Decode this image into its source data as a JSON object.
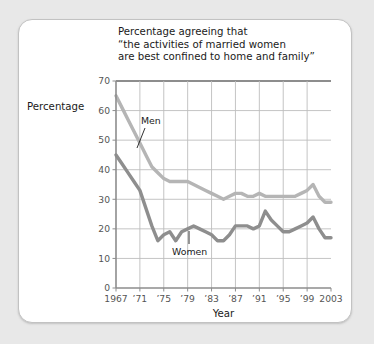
{
  "figure": {
    "background_color": "#e8e8e8",
    "card_color": "#ffffff",
    "card_border_color": "#c2c2c2"
  },
  "chart_data": {
    "type": "line",
    "title_lines": [
      "Percentage agreeing that",
      "“the activities of married women",
      "are best confined to home and family”"
    ],
    "xlabel": "Year",
    "ylabel": "Percentage",
    "xlim": [
      1967,
      2003
    ],
    "ylim": [
      0,
      70
    ],
    "yticks": [
      0,
      10,
      20,
      30,
      40,
      50,
      60,
      70
    ],
    "ytick_labels": [
      "0",
      "10",
      "20",
      "30",
      "40",
      "50",
      "60",
      "70"
    ],
    "xticks": [
      1967,
      1971,
      1975,
      1979,
      1983,
      1987,
      1991,
      1995,
      1999,
      2003
    ],
    "xtick_labels": [
      "1967",
      "’71",
      "’75",
      "’79",
      "’83",
      "’87",
      "’91",
      "’95",
      "’99",
      "2003"
    ],
    "grid": {
      "horizontal": true,
      "vertical": true,
      "vertical_at": [
        1971,
        1975,
        1979,
        1983,
        1987,
        1991,
        1995,
        1999
      ],
      "color": "#bdbdbd"
    },
    "legend_position": "inline-annotation",
    "x": [
      1967,
      1968,
      1969,
      1970,
      1971,
      1972,
      1973,
      1974,
      1975,
      1976,
      1977,
      1978,
      1979,
      1980,
      1981,
      1982,
      1983,
      1984,
      1985,
      1986,
      1987,
      1988,
      1989,
      1990,
      1991,
      1992,
      1993,
      1994,
      1995,
      1996,
      1997,
      1998,
      1999,
      2000,
      2001,
      2002,
      2003
    ],
    "series": [
      {
        "name": "Men",
        "color": "#b5b5b5",
        "label_position_year": 1973,
        "values": [
          65,
          61,
          57,
          53,
          49,
          45,
          41,
          39,
          37,
          36,
          36,
          36,
          36,
          35,
          34,
          33,
          32,
          31,
          30,
          31,
          32,
          32,
          31,
          31,
          32,
          31,
          31,
          31,
          31,
          31,
          31,
          32,
          33,
          35,
          31,
          29,
          29
        ]
      },
      {
        "name": "Women",
        "color": "#8e8e8e",
        "label_position_year": 1979,
        "values": [
          45,
          42,
          39,
          36,
          33,
          27,
          21,
          16,
          18,
          19,
          16,
          19,
          20,
          21,
          20,
          19,
          18,
          16,
          16,
          18,
          21,
          21,
          21,
          20,
          21,
          26,
          23,
          21,
          19,
          19,
          20,
          21,
          22,
          24,
          20,
          17,
          17
        ]
      }
    ],
    "annotations": [
      {
        "text": "Men",
        "series": "Men"
      },
      {
        "text": "Women",
        "series": "Women"
      }
    ]
  }
}
